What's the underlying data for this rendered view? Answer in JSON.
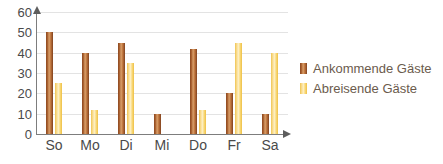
{
  "chart_data": {
    "type": "bar",
    "title": "",
    "xlabel": "",
    "ylabel": "",
    "categories": [
      "So",
      "Mo",
      "Di",
      "Mi",
      "Do",
      "Fr",
      "Sa"
    ],
    "series": [
      {
        "name": "Ankommende Gäste",
        "color": "#c27a42",
        "values": [
          50,
          40,
          45,
          10,
          42,
          20,
          10
        ]
      },
      {
        "name": "Abreisende Gäste",
        "color": "#f7d369",
        "values": [
          25,
          12,
          35,
          0,
          12,
          45,
          40
        ]
      }
    ],
    "ylim": [
      0,
      60
    ],
    "yticks": [
      0,
      10,
      20,
      30,
      40,
      50,
      60
    ],
    "ytick_labels": [
      "0",
      "10",
      "20",
      "30",
      "40",
      "50",
      "60"
    ],
    "grid": true,
    "legend_position": "right",
    "axis_color": "#7d7d7d",
    "grid_color": "#e3e3e3",
    "background": "#ffffff"
  }
}
